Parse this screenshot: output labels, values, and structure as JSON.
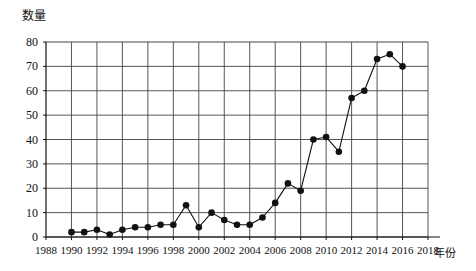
{
  "chart_data": {
    "type": "line",
    "title": "",
    "xlabel": "年份",
    "ylabel": "数量",
    "xlim": [
      1988,
      2018
    ],
    "ylim": [
      0,
      80
    ],
    "grid": true,
    "legend": false,
    "marker": "filled-circle",
    "ytick_labels": [
      "0",
      "10",
      "20",
      "30",
      "40",
      "50",
      "60",
      "70",
      "80"
    ],
    "ytick_values": [
      0,
      10,
      20,
      30,
      40,
      50,
      60,
      70,
      80
    ],
    "xtick_labels": [
      "1988",
      "1990",
      "1992",
      "1994",
      "1996",
      "1998",
      "2000",
      "2002",
      "2004",
      "2006",
      "2008",
      "2010",
      "2012",
      "2014",
      "2016",
      "2018"
    ],
    "xtick_values": [
      1988,
      1990,
      1992,
      1994,
      1996,
      1998,
      2000,
      2002,
      2004,
      2006,
      2008,
      2010,
      2012,
      2014,
      2016,
      2018
    ],
    "x": [
      1990,
      1991,
      1992,
      1993,
      1994,
      1995,
      1996,
      1997,
      1998,
      1999,
      2000,
      2001,
      2002,
      2003,
      2004,
      2005,
      2006,
      2007,
      2008,
      2009,
      2010,
      2011,
      2012,
      2013,
      2014,
      2015,
      2016
    ],
    "values": [
      2,
      2,
      3,
      1,
      3,
      4,
      4,
      5,
      5,
      13,
      4,
      10,
      7,
      5,
      5,
      8,
      14,
      22,
      19,
      40,
      41,
      35,
      57,
      60,
      73,
      75,
      70
    ],
    "series": [
      {
        "name": "数量",
        "values": [
          2,
          2,
          3,
          1,
          3,
          4,
          4,
          5,
          5,
          13,
          4,
          10,
          7,
          5,
          5,
          8,
          14,
          22,
          19,
          40,
          41,
          35,
          57,
          60,
          73,
          75,
          70
        ]
      }
    ]
  }
}
